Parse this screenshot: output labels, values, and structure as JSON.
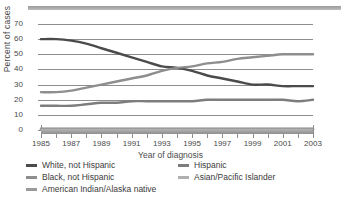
{
  "chart_data": {
    "type": "line",
    "title": "",
    "xlabel": "Year of diagnosis",
    "ylabel": "Percent of cases",
    "xlim": [
      1985,
      2003
    ],
    "ylim": [
      0,
      70
    ],
    "grid": true,
    "legend_position": "bottom",
    "x": [
      1985,
      1986,
      1987,
      1988,
      1989,
      1990,
      1991,
      1992,
      1993,
      1994,
      1995,
      1996,
      1997,
      1998,
      1999,
      2000,
      2001,
      2002,
      2003
    ],
    "yticks": [
      "0",
      "10",
      "20",
      "30",
      "40",
      "50",
      "60",
      "70"
    ],
    "xticks": [
      "1985",
      "1987",
      "1989",
      "1991",
      "1993",
      "1995",
      "1997",
      "1999",
      "2001",
      "2003"
    ],
    "series": [
      {
        "name": "White, not Hispanic",
        "color": "#4b4b4b",
        "values": [
          60,
          60,
          59,
          57,
          54,
          51,
          48,
          45,
          42,
          41,
          39,
          36,
          34,
          32,
          30,
          30,
          29,
          29,
          29
        ]
      },
      {
        "name": "Black, not Hispanic",
        "color": "#8e8e8e",
        "values": [
          25,
          25,
          26,
          28,
          30,
          32,
          34,
          36,
          39,
          41,
          42,
          44,
          45,
          47,
          48,
          49,
          50,
          50,
          50
        ]
      },
      {
        "name": "Hispanic",
        "color": "#7d7d7d",
        "values": [
          16,
          16,
          16,
          17,
          18,
          18,
          19,
          19,
          19,
          19,
          19,
          20,
          20,
          20,
          20,
          20,
          20,
          19,
          20
        ]
      },
      {
        "name": "Asian/Pacific Islander",
        "color": "#b0b0b0",
        "values": [
          1,
          1,
          1,
          1,
          1,
          1,
          1,
          1,
          1,
          1,
          1,
          1,
          1,
          1,
          1,
          1,
          1,
          1,
          1
        ]
      },
      {
        "name": "American Indian/Alaska native",
        "color": "#9a9a9a",
        "values": [
          0.5,
          0.5,
          0.5,
          0.5,
          0.5,
          0.5,
          0.5,
          0.5,
          0.5,
          0.5,
          0.5,
          0.5,
          0.5,
          0.5,
          0.5,
          0.5,
          0.5,
          0.5,
          0.5
        ]
      }
    ]
  },
  "legend": {
    "rows": [
      [
        {
          "label": "White, not Hispanic",
          "color": "#4b4b4b"
        },
        {
          "label": "Hispanic",
          "color": "#7d7d7d"
        }
      ],
      [
        {
          "label": "Black, not Hispanic",
          "color": "#8e8e8e"
        },
        {
          "label": "Asian/Pacific Islander",
          "color": "#b0b0b0"
        }
      ],
      [
        {
          "label": "American Indian/Alaska native",
          "color": "#9a9a9a"
        }
      ]
    ]
  }
}
